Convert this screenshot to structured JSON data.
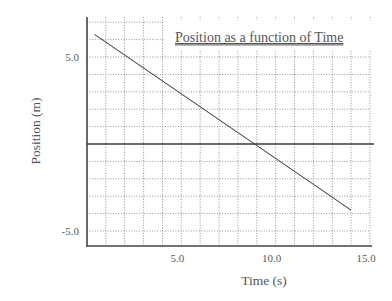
{
  "chart_data": {
    "type": "line",
    "title": "Position as a function of Time",
    "xlabel": "Time (s)",
    "ylabel": "Position (m)",
    "xlim": [
      0,
      15.0
    ],
    "ylim": [
      -5.9,
      7.3
    ],
    "x_ticks": [
      {
        "value": 5.0,
        "label": "5.0"
      },
      {
        "value": 10.0,
        "label": "10.0"
      },
      {
        "value": 15.0,
        "label": "15.0"
      }
    ],
    "y_ticks": [
      {
        "value": 5.0,
        "label": "5.0"
      },
      {
        "value": -5.0,
        "label": "-5.0"
      }
    ],
    "grid": true,
    "grid_style": "dotted",
    "x_grid_step": 1.0,
    "y_grid_step": 1.0,
    "legend": false,
    "series": [
      {
        "name": "Position",
        "x": [
          0.4,
          14.0
        ],
        "y": [
          6.3,
          -3.8
        ]
      }
    ],
    "annotations": [
      {
        "text": "horizontal reference line at Position = 0",
        "y": 0
      }
    ]
  },
  "colors": {
    "background": "#ffffff",
    "line": "#4a4a4a",
    "grid": "#8a8a8a",
    "axis": "#444444",
    "text": "#555555"
  }
}
